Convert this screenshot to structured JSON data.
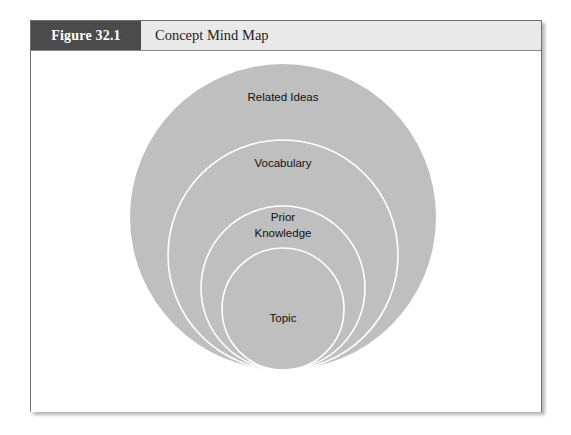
{
  "figure": {
    "number_label": "Figure 32.1",
    "title": "Concept Mind Map"
  },
  "colors": {
    "header_background": "#e9e9e9",
    "number_block_background": "#4b4b4b",
    "number_block_text": "#ffffff",
    "title_text": "#1d1d1d",
    "circle_fill": "#bfbfbf",
    "circle_outline": "#ffffff",
    "label_text": "#101010",
    "frame_border": "#6f6f6f",
    "page_background": "#ffffff"
  },
  "chart_data": {
    "type": "diagram",
    "subtype": "nested-concentric-circles",
    "title": "Concept Mind Map",
    "rings": [
      {
        "index": 1,
        "label": "Related Ideas",
        "level": "outermost",
        "center_x": 252,
        "center_y": 166,
        "radius": 153,
        "outlined": false
      },
      {
        "index": 2,
        "label": "Vocabulary",
        "level": "second",
        "center_x": 252,
        "center_y": 204,
        "radius": 115,
        "outlined": true
      },
      {
        "index": 3,
        "label": "Prior Knowledge",
        "label_lines": [
          "Prior",
          "Knowledge"
        ],
        "level": "third",
        "center_x": 252,
        "center_y": 237,
        "radius": 82,
        "outlined": true
      },
      {
        "index": 4,
        "label": "Topic",
        "level": "innermost",
        "center_x": 252,
        "center_y": 258,
        "radius": 61,
        "outlined": true
      }
    ],
    "label_positions": [
      {
        "text": "Related Ideas",
        "x": 252,
        "y": 47
      },
      {
        "text": "Vocabulary",
        "x": 252,
        "y": 113
      },
      {
        "text": "Prior",
        "x": 252,
        "y": 167
      },
      {
        "text": "Knowledge",
        "x": 252,
        "y": 183
      },
      {
        "text": "Topic",
        "x": 252,
        "y": 268
      }
    ]
  }
}
